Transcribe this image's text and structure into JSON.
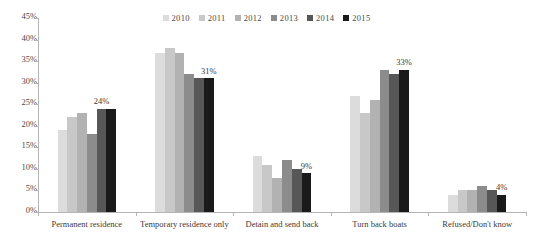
{
  "chart_data": {
    "type": "bar",
    "title": "",
    "subtitle": "",
    "xlabel": "",
    "ylabel": "",
    "ylim": [
      0,
      45
    ],
    "ytick_labels": [
      "45%",
      "40%",
      "35%",
      "30%",
      "25%",
      "20%",
      "15%",
      "10%",
      "5%",
      "0%"
    ],
    "ytick_values": [
      45,
      40,
      35,
      30,
      25,
      20,
      15,
      10,
      5,
      0
    ],
    "grid": false,
    "legend_position": "top-center",
    "categories": [
      "Permanent residence",
      "Temporary residence only",
      "Detain and send back",
      "Turn back boats",
      "Refused/Don't know"
    ],
    "series": [
      {
        "name": "2010",
        "color": "#dcdcdc",
        "values": [
          19,
          37,
          13,
          27,
          4
        ]
      },
      {
        "name": "2011",
        "color": "#c8c8c8",
        "values": [
          22,
          38,
          11,
          23,
          5
        ]
      },
      {
        "name": "2012",
        "color": "#b2b2b2",
        "values": [
          23,
          37,
          8,
          26,
          5
        ]
      },
      {
        "name": "2013",
        "color": "#8c8c8c",
        "values": [
          18,
          32,
          12,
          33,
          6
        ]
      },
      {
        "name": "2014",
        "color": "#575757",
        "values": [
          24,
          31,
          10,
          32,
          5
        ]
      },
      {
        "name": "2015",
        "color": "#1a1a1a",
        "values": [
          24,
          31,
          9,
          33,
          4
        ]
      }
    ],
    "data_labels": [
      {
        "category_index": 0,
        "series_index": 4,
        "text": "24%"
      },
      {
        "category_index": 1,
        "series_index": 5,
        "text": "31%"
      },
      {
        "category_index": 2,
        "series_index": 5,
        "text": "9%"
      },
      {
        "category_index": 3,
        "series_index": 5,
        "text": "33%"
      },
      {
        "category_index": 4,
        "series_index": 5,
        "text": "4%"
      }
    ]
  }
}
